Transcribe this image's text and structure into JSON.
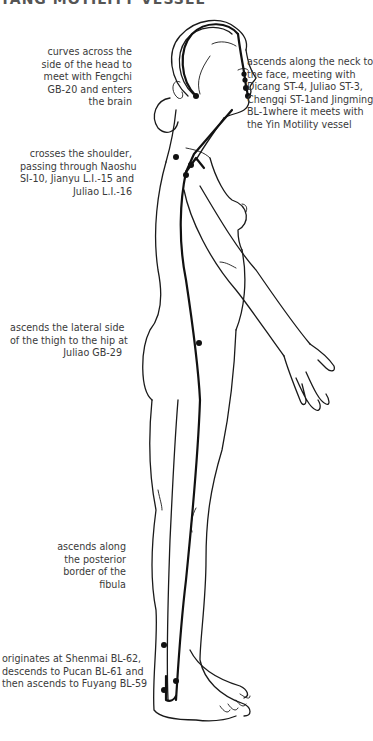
{
  "heading": {
    "text": "YANG MOTILITY VESSEL"
  },
  "annotations": [
    {
      "id": "head",
      "side": "right-aligned",
      "lines": [
        "curves across the",
        "side of the head to",
        "meet with Fengchi",
        "GB-20 and enters",
        "the brain"
      ]
    },
    {
      "id": "face",
      "side": "left-aligned",
      "lines": [
        "ascends along the neck to",
        "the face, meeting with",
        "Dicang ST-4, Juliao ST-3,",
        "Chengqi ST-1and Jingming",
        "BL-1where it meets with",
        "the Yin Motility vessel"
      ]
    },
    {
      "id": "shoulder",
      "side": "right-aligned",
      "lines": [
        "crosses the shoulder,",
        "passing through Naoshu",
        "SI-10, Jianyu L.I.-15 and",
        "Juliao L.I.-16"
      ]
    },
    {
      "id": "thigh",
      "side": "right-aligned",
      "lines": [
        "ascends the lateral side",
        "of the thigh to the hip at",
        "Juliao GB-29"
      ]
    },
    {
      "id": "fibula",
      "side": "right-aligned",
      "lines": [
        "ascends along",
        "the posterior",
        "border of the",
        "fibula"
      ]
    },
    {
      "id": "ankle",
      "side": "right-aligned",
      "lines": [
        "originates at Shenmai BL-62,",
        "descends to Pucan BL-61 and",
        "then ascends to Fuyang BL-59"
      ]
    }
  ],
  "colors": {
    "line": "#1a1a1a",
    "text": "#3a3a3a",
    "background": "#ffffff"
  }
}
